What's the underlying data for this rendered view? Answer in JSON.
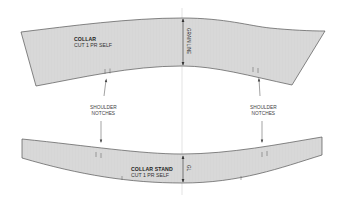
{
  "diagram": {
    "type": "sewing-pattern",
    "colors": {
      "fill": "#d6d6d6",
      "outline": "#555555",
      "text": "#222222",
      "center_line": "#bbbbbb"
    },
    "pieces": {
      "collar": {
        "title": "COLLAR",
        "subtitle": "CUT 1 PR SELF",
        "grain_label": "GRAIN LINE"
      },
      "collar_stand": {
        "title": "COLLAR STAND",
        "subtitle": "CUT 1 PR SELF",
        "grain_label": "GL"
      }
    },
    "annotations": {
      "left_notch_label_line1": "SHOULDER",
      "left_notch_label_line2": "NOTCHES",
      "right_notch_label_line1": "SHOULDER",
      "right_notch_label_line2": "NOTCHES"
    }
  }
}
